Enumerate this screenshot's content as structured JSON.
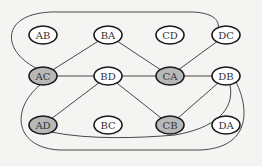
{
  "diagram": {
    "type": "graph",
    "colors": {
      "background": "#f4f4f2",
      "node_fill": "#ffffff",
      "node_fill_highlighted": "#b8b8b8",
      "stroke": "#1a1a1a",
      "edge": "#333333"
    },
    "nodes": [
      {
        "id": "AB",
        "label": "AB",
        "x": 43,
        "y": 35,
        "highlighted": false
      },
      {
        "id": "BA",
        "label": "BA",
        "x": 108,
        "y": 35,
        "highlighted": false
      },
      {
        "id": "CD",
        "label": "CD",
        "x": 170,
        "y": 35,
        "highlighted": false
      },
      {
        "id": "DC",
        "label": "DC",
        "x": 226,
        "y": 35,
        "highlighted": false
      },
      {
        "id": "AC",
        "label": "AC",
        "x": 43,
        "y": 76,
        "highlighted": true
      },
      {
        "id": "BD",
        "label": "BD",
        "x": 108,
        "y": 76,
        "highlighted": false
      },
      {
        "id": "CA",
        "label": "CA",
        "x": 170,
        "y": 76,
        "highlighted": true
      },
      {
        "id": "DB",
        "label": "DB",
        "x": 226,
        "y": 76,
        "highlighted": false
      },
      {
        "id": "AD",
        "label": "AD",
        "x": 43,
        "y": 125,
        "highlighted": true
      },
      {
        "id": "BC",
        "label": "BC",
        "x": 108,
        "y": 125,
        "highlighted": false
      },
      {
        "id": "CB",
        "label": "CB",
        "x": 170,
        "y": 125,
        "highlighted": true
      },
      {
        "id": "DA",
        "label": "DA",
        "x": 226,
        "y": 125,
        "highlighted": false
      }
    ],
    "edges": [
      {
        "from": "AC",
        "to": "BA",
        "shape": "straight"
      },
      {
        "from": "AC",
        "to": "BD",
        "shape": "straight"
      },
      {
        "from": "BA",
        "to": "CA",
        "shape": "straight"
      },
      {
        "from": "BD",
        "to": "CA",
        "shape": "straight"
      },
      {
        "from": "CA",
        "to": "DC",
        "shape": "straight"
      },
      {
        "from": "CA",
        "to": "DB",
        "shape": "straight"
      },
      {
        "from": "BD",
        "to": "AD",
        "shape": "straight"
      },
      {
        "from": "BD",
        "to": "CB",
        "shape": "straight"
      },
      {
        "from": "DB",
        "to": "CB",
        "shape": "straight"
      },
      {
        "from": "AC",
        "to": "DC",
        "shape": "curve-top"
      },
      {
        "from": "AD",
        "to": "DB",
        "shape": "curve-bottom-inner"
      },
      {
        "from": "AC",
        "to": "DB",
        "shape": "curve-bottom-outer"
      }
    ]
  }
}
